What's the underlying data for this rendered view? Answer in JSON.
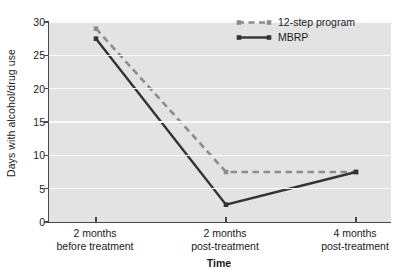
{
  "chart_data": {
    "type": "line",
    "title": "",
    "xlabel": "Time",
    "ylabel": "Days with alcohol/drug use",
    "categories": [
      "2 months\nbefore treatment",
      "2 months\npost-treatment",
      "4 months\npost-treatment"
    ],
    "category_lines": [
      [
        "2 months",
        "before treatment"
      ],
      [
        "2 months",
        "post-treatment"
      ],
      [
        "4 months",
        "post-treatment"
      ]
    ],
    "series": [
      {
        "name": "12-step program",
        "values": [
          29,
          7.5,
          7.5
        ],
        "color": "#8c8c8c",
        "style": "dashed",
        "marker": "square"
      },
      {
        "name": "MBRP",
        "values": [
          27.5,
          2.6,
          7.5
        ],
        "color": "#333333",
        "style": "solid",
        "marker": "square"
      }
    ],
    "ylim": [
      0,
      30
    ],
    "yticks": [
      0,
      5,
      10,
      15,
      20,
      25,
      30
    ],
    "ytick_labels": [
      "0",
      "5",
      "10",
      "15",
      "20",
      "25",
      "30"
    ],
    "xlim": [
      0,
      2
    ],
    "grid": "horizontal",
    "grid_color": "#fafafa",
    "plot_background": "#e3e3e3",
    "axis_color": "#4a4a4a",
    "legend_position": "top-right"
  },
  "legend": {
    "entries": [
      {
        "label": "12-step program"
      },
      {
        "label": "MBRP"
      }
    ]
  }
}
